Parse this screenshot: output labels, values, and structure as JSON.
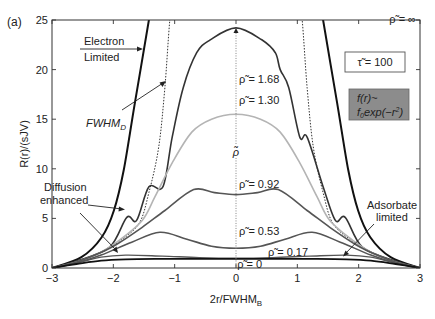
{
  "panel_label": "(a)",
  "chart_data": {
    "type": "line",
    "title": "",
    "xlabel": "2r/FWHM",
    "xlabel_sub": "B",
    "ylabel": "R(r)/(sJV)",
    "xlim": [
      -3,
      3
    ],
    "ylim": [
      0,
      25
    ],
    "xticks": [
      -3,
      -2,
      -1,
      0,
      1,
      2,
      3
    ],
    "xtick_labels": [
      "−3",
      "−2",
      "−1",
      "0",
      "1",
      "2",
      "3"
    ],
    "yticks": [
      0,
      5,
      10,
      15,
      20,
      25
    ],
    "ytick_labels": [
      "0",
      "5",
      "10",
      "15",
      "20",
      "25"
    ],
    "grid": false,
    "series": [
      {
        "name": "ρ̃ = ∞",
        "label": "ρ̃ = ∞",
        "color": "#111111",
        "width": 2.0,
        "dash": "",
        "x": [
          -3.0,
          -2.52,
          -2.19,
          -1.99,
          -1.83,
          -1.65,
          -1.42,
          -1.3,
          1.3,
          1.42,
          1.65,
          1.83,
          1.99,
          2.19,
          2.52,
          3.0
        ],
        "y": [
          0.0,
          1.1,
          3.1,
          5.8,
          9.9,
          16.6,
          25.0,
          30.0,
          30.0,
          25.0,
          16.6,
          9.9,
          5.8,
          3.1,
          1.1,
          0.0
        ]
      },
      {
        "name": "FWHM_D",
        "label": "FWHM_D (dotted)",
        "color": "#333333",
        "width": 1.0,
        "dash": "1.5,1.5",
        "x": [
          -3.0,
          -2.6,
          -2.2,
          -1.9,
          -1.58,
          -1.42,
          -1.26,
          -1.16,
          -1.08,
          -1.0,
          1.0,
          1.08,
          1.16,
          1.26,
          1.42,
          1.58,
          1.9,
          2.2,
          2.6,
          3.0
        ],
        "y": [
          0.0,
          0.6,
          1.6,
          2.7,
          4.5,
          7.6,
          12.2,
          18.2,
          25.0,
          30.0,
          30.0,
          25.0,
          18.2,
          12.2,
          7.6,
          4.5,
          2.7,
          1.6,
          0.6,
          0.0
        ]
      },
      {
        "name": "ρ̃ = 1.68",
        "label": "ρ̃ = 1.68",
        "color": "#333333",
        "width": 1.6,
        "dash": "",
        "x": [
          -3.0,
          -2.6,
          -2.06,
          -1.78,
          -1.62,
          -1.42,
          -1.19,
          -1.04,
          -0.86,
          -0.64,
          -0.42,
          0.0,
          0.42,
          0.64,
          0.72,
          0.86,
          1.04,
          1.16,
          1.42,
          1.62,
          1.78,
          2.06,
          2.6,
          3.0
        ],
        "y": [
          0.0,
          0.7,
          2.1,
          5.1,
          4.8,
          8.2,
          8.2,
          13.2,
          18.2,
          21.7,
          23.0,
          24.2,
          23.0,
          21.7,
          20.0,
          18.2,
          13.2,
          13.2,
          8.2,
          4.8,
          5.1,
          2.1,
          0.7,
          0.0
        ]
      },
      {
        "name": "ρ̃ = 1.30",
        "label": "ρ̃ = 1.30",
        "color": "#b4b4b4",
        "width": 1.6,
        "dash": "",
        "x": [
          -3.0,
          -2.6,
          -2.2,
          -1.9,
          -1.53,
          -1.32,
          -1.04,
          -0.72,
          -0.4,
          0.0,
          0.4,
          0.72,
          1.04,
          1.32,
          1.53,
          1.9,
          2.2,
          2.6,
          3.0
        ],
        "y": [
          0.0,
          0.6,
          1.6,
          2.8,
          4.8,
          7.2,
          10.6,
          13.7,
          15.0,
          15.5,
          15.0,
          13.7,
          10.6,
          7.2,
          4.8,
          2.8,
          1.6,
          0.6,
          0.0
        ]
      },
      {
        "name": "ρ̃ = 0.92",
        "label": "ρ̃ = 0.92",
        "color": "#555555",
        "width": 1.6,
        "dash": "",
        "x": [
          -3.0,
          -2.6,
          -2.3,
          -1.97,
          -1.53,
          -1.16,
          -0.69,
          -0.35,
          0.0,
          0.35,
          0.69,
          1.16,
          1.53,
          1.97,
          2.3,
          2.6,
          3.0
        ],
        "y": [
          0.0,
          0.6,
          1.3,
          2.3,
          4.1,
          5.8,
          7.9,
          7.6,
          7.4,
          7.6,
          7.9,
          5.8,
          4.1,
          2.3,
          1.3,
          0.6,
          0.0
        ]
      },
      {
        "name": "ρ̃ = 0.53",
        "label": "ρ̃ = 0.53",
        "color": "#555555",
        "width": 1.6,
        "dash": "",
        "x": [
          -3.0,
          -2.6,
          -2.2,
          -1.7,
          -1.24,
          -0.8,
          -0.4,
          0.0,
          0.4,
          0.8,
          1.24,
          1.7,
          2.2,
          2.6,
          3.0
        ],
        "y": [
          0.0,
          0.5,
          1.3,
          2.6,
          3.6,
          2.9,
          2.2,
          2.0,
          2.2,
          2.9,
          3.6,
          2.6,
          1.3,
          0.5,
          0.0
        ]
      },
      {
        "name": "ρ̃ = 0.17",
        "label": "ρ̃ = 0.17",
        "color": "#555555",
        "width": 1.4,
        "dash": "",
        "x": [
          -3.0,
          -2.6,
          -2.2,
          -1.8,
          -1.2,
          -0.6,
          0.0,
          0.6,
          1.2,
          1.8,
          2.2,
          2.6,
          3.0
        ],
        "y": [
          0.0,
          0.5,
          1.1,
          1.3,
          1.2,
          1.05,
          1.0,
          1.05,
          1.2,
          1.3,
          1.1,
          0.5,
          0.0
        ]
      },
      {
        "name": "ρ̃ = 0",
        "label": "ρ̃ = 0",
        "color": "#111111",
        "width": 1.8,
        "dash": "",
        "x": [
          -3.0,
          -2.6,
          -2.2,
          -1.8,
          -1.2,
          0.0,
          1.2,
          1.8,
          2.2,
          2.6,
          3.0
        ],
        "y": [
          0.0,
          0.4,
          0.75,
          0.88,
          0.92,
          0.93,
          0.92,
          0.88,
          0.75,
          0.4,
          0.0
        ]
      }
    ],
    "center_line": {
      "x": 0,
      "style": "dotted",
      "label": "ρ̃"
    },
    "annotations": [
      {
        "id": "electron-limited",
        "lines": [
          "Electron",
          "Limited"
        ]
      },
      {
        "id": "fwhm-d",
        "text": "FWHM",
        "sub": "D"
      },
      {
        "id": "diffusion-enhanced",
        "lines": [
          "Diffusion",
          "enhanced"
        ]
      },
      {
        "id": "adsorbate-limited",
        "lines": [
          "Adsorbate",
          "limited"
        ]
      }
    ],
    "curve_labels": [
      {
        "text": "ρ̃ = ∞",
        "u": 2.5,
        "r": 24.7
      },
      {
        "text": "ρ̃ = 1.68",
        "u": 0.05,
        "r": 18.6
      },
      {
        "text": "ρ̃ = 1.30",
        "u": 0.05,
        "r": 16.5
      },
      {
        "text": "ρ̃ = 0.92",
        "u": 0.05,
        "r": 8.1
      },
      {
        "text": "ρ̃ = 0.53",
        "u": 0.05,
        "r": 3.3
      },
      {
        "text": "ρ̃ = 0.17",
        "u": 0.52,
        "r": 1.2
      },
      {
        "text": "ρ̃ = 0",
        "u": 0.02,
        "r": 0.05
      }
    ],
    "legend_boxes": {
      "tau": "τ̃ = 100",
      "profile_line1": "f(r)~",
      "profile_line2_a": "f",
      "profile_line2_sub": "0",
      "profile_line2_b": "exp(−r",
      "profile_line2_sup": "2",
      "profile_line2_c": ")",
      "profile_fill": "#8c8c8c"
    }
  }
}
